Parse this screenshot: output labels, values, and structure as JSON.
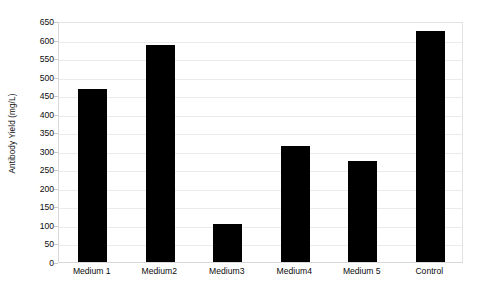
{
  "chart_data": {
    "type": "bar",
    "title": "",
    "subtitle": "",
    "xlabel": "",
    "ylabel": "Antibody Yield (mg/L)",
    "categories": [
      "Medium 1",
      "Medium2",
      "Medium3",
      "Medium4",
      "Medium 5",
      "Control"
    ],
    "values": [
      467,
      585,
      102,
      312,
      272,
      622
    ],
    "series": [
      {
        "name": "Antibody Yield",
        "values": [
          467,
          585,
          102,
          312,
          272,
          622
        ],
        "color": "#000000"
      }
    ],
    "ylim": [
      0,
      650
    ],
    "ytick_labels": [
      "0",
      "50",
      "100",
      "150",
      "200",
      "250",
      "300",
      "350",
      "400",
      "450",
      "500",
      "550",
      "600",
      "650"
    ],
    "ytick_values": [
      0,
      50,
      100,
      150,
      200,
      250,
      300,
      350,
      400,
      450,
      500,
      550,
      600,
      650
    ],
    "grid": true,
    "grid_axis": "y",
    "grid_color": "#ebebeb",
    "legend": false,
    "legend_position": "none",
    "bar_color": "#000000",
    "background_color": "#ffffff",
    "plot_border_color": "#e2e2e2",
    "annotations": []
  }
}
